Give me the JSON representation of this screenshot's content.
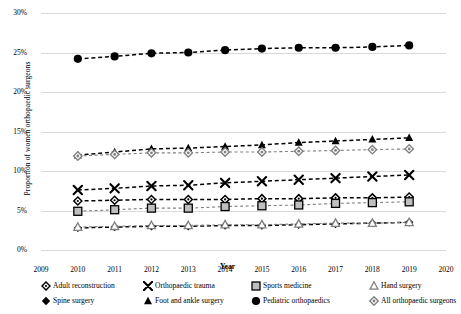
{
  "chart_data": {
    "type": "line",
    "title": "",
    "xlabel": "Year",
    "ylabel": "Proportion of women orthopaedic surgeons",
    "x": [
      2010,
      2011,
      2012,
      2013,
      2014,
      2015,
      2016,
      2017,
      2018,
      2019
    ],
    "xlim": [
      2009,
      2020
    ],
    "xticks": [
      "2009",
      "2010",
      "2011",
      "2012",
      "2013",
      "2014",
      "2015",
      "2016",
      "2017",
      "2018",
      "2019",
      "2020"
    ],
    "ylim": [
      0,
      30
    ],
    "yticks": [
      "0%",
      "5%",
      "10%",
      "15%",
      "20%",
      "25%",
      "30%"
    ],
    "ytick_values": [
      0,
      5,
      10,
      15,
      20,
      25,
      30
    ],
    "grid": true,
    "legend_position": "bottom",
    "series": [
      {
        "name": "Adult reconstruction",
        "marker": "open-diamond",
        "values": [
          6.2,
          6.3,
          6.4,
          6.4,
          6.4,
          6.5,
          6.5,
          6.6,
          6.6,
          6.7
        ]
      },
      {
        "name": "Sports medicine",
        "marker": "gray-square",
        "values": [
          4.9,
          5.1,
          5.3,
          5.3,
          5.5,
          5.6,
          5.7,
          5.9,
          6.0,
          6.1
        ]
      },
      {
        "name": "Spine surgery",
        "marker": "filled-diamond",
        "values": [
          2.8,
          2.9,
          3.0,
          3.0,
          3.1,
          3.1,
          3.2,
          3.3,
          3.4,
          3.5
        ]
      },
      {
        "name": "Pediatric orthopaedics",
        "marker": "filled-circle",
        "values": [
          24.2,
          24.5,
          24.9,
          25.0,
          25.3,
          25.5,
          25.6,
          25.6,
          25.7,
          25.9
        ]
      },
      {
        "name": "Orthopaedic trauma",
        "marker": "cross-x",
        "values": [
          7.6,
          7.8,
          8.1,
          8.2,
          8.5,
          8.7,
          8.9,
          9.1,
          9.3,
          9.5
        ]
      },
      {
        "name": "Hand surgery",
        "marker": "open-triangle",
        "values": [
          2.9,
          3.0,
          3.1,
          3.1,
          3.2,
          3.2,
          3.3,
          3.4,
          3.4,
          3.5
        ]
      },
      {
        "name": "Foot and ankle surgery",
        "marker": "filled-triangle",
        "values": [
          12.0,
          12.4,
          12.8,
          12.9,
          13.1,
          13.3,
          13.6,
          13.8,
          14.0,
          14.2
        ]
      },
      {
        "name": "All orthopaedic surgeons",
        "marker": "open-diamond-dot",
        "values": [
          11.9,
          12.1,
          12.3,
          12.3,
          12.4,
          12.4,
          12.5,
          12.6,
          12.7,
          12.8
        ]
      }
    ]
  },
  "colors": {
    "grid": "#d9d9d9",
    "dark": "#000000",
    "light": "#808080",
    "square_fill": "#bfbfbf",
    "text": "#000000"
  }
}
